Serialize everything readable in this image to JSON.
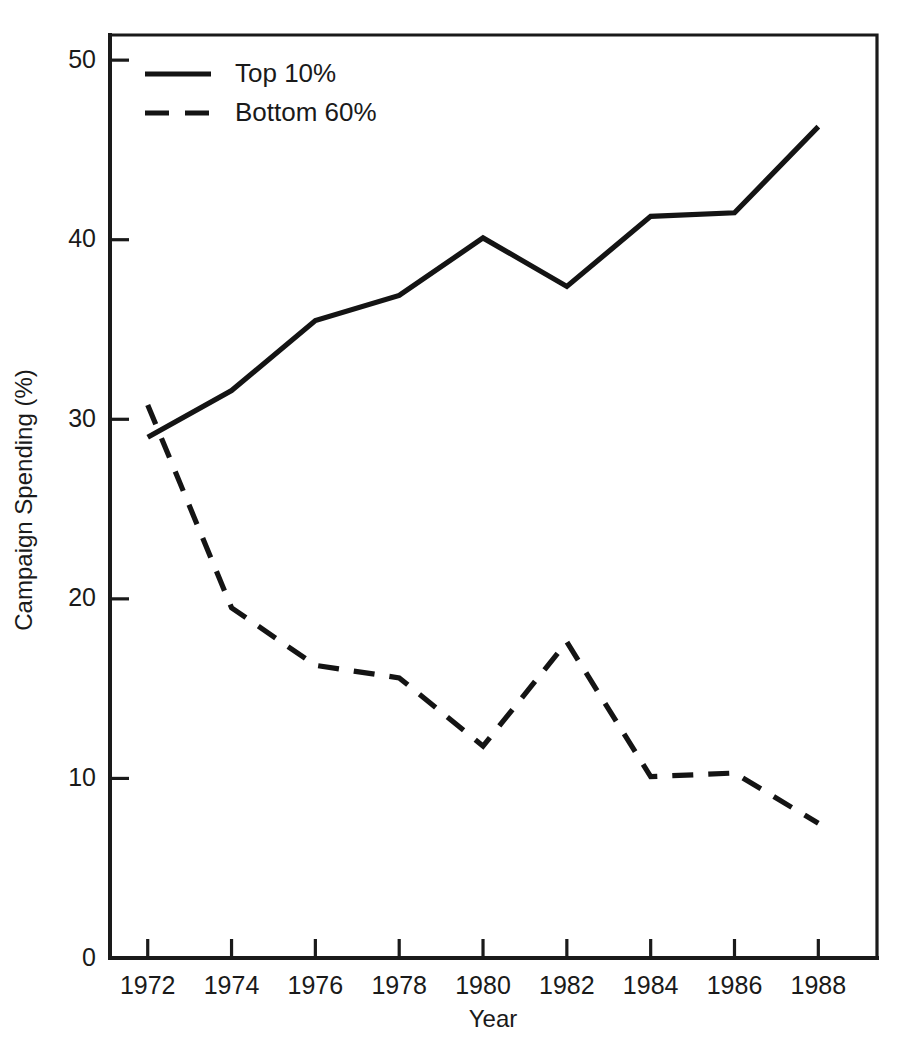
{
  "chart_data": {
    "type": "line",
    "title": "",
    "xlabel": "Year",
    "ylabel": "Campaign Spending (%)",
    "x": [
      1972,
      1974,
      1976,
      1978,
      1980,
      1982,
      1984,
      1986,
      1988
    ],
    "xtick_labels": [
      "1972",
      "1974",
      "1976",
      "1978",
      "1980",
      "1982",
      "1984",
      "1986",
      "1988"
    ],
    "ytick_labels": [
      "0",
      "10",
      "20",
      "30",
      "40",
      "50"
    ],
    "yticks": [
      0,
      10,
      20,
      30,
      40,
      50
    ],
    "xlim": [
      1971.1,
      1989.4
    ],
    "ylim": [
      0,
      51.4
    ],
    "grid": false,
    "legend_position": "top-left",
    "series": [
      {
        "name": "Top 10%",
        "style": "solid",
        "color": "#141414",
        "values": [
          29.0,
          31.6,
          35.5,
          36.9,
          40.1,
          37.4,
          41.3,
          41.5,
          46.3
        ]
      },
      {
        "name": "Bottom 60%",
        "style": "dashed",
        "color": "#141414",
        "values": [
          30.8,
          19.5,
          16.3,
          15.6,
          11.8,
          17.6,
          10.1,
          10.3,
          7.5
        ]
      }
    ]
  },
  "legend": {
    "entries": [
      {
        "label": "Top 10%",
        "style": "solid"
      },
      {
        "label": "Bottom 60%",
        "style": "dashed"
      }
    ]
  }
}
